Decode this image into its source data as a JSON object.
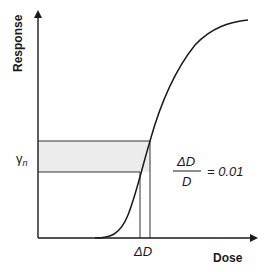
{
  "diagram": {
    "type": "dose-response-curve",
    "y_axis_label": "Response",
    "x_axis_label": "Dose",
    "gamma_label": "γ",
    "gamma_subscript": "n",
    "delta_label": "ΔD",
    "formula": {
      "numerator": "ΔD",
      "denominator": "D",
      "rhs": "= 0.01"
    },
    "colors": {
      "ink": "#1a1a1a",
      "shade": "#ececec"
    }
  }
}
